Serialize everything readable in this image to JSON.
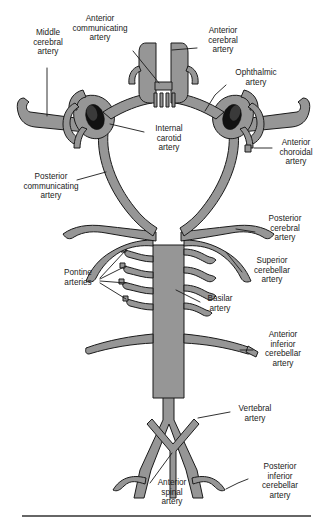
{
  "figure": {
    "colors": {
      "vessel_fill": "#969696",
      "vessel_outline": "#1a1a1a",
      "lumen": "#111111",
      "background": "#ffffff",
      "rule": "#333333"
    }
  },
  "labels": {
    "middle_cerebral": "Middle\ncerebral\nartery",
    "anterior_communicating": "Anterior\ncommunicating\nartery",
    "anterior_cerebral": "Anterior\ncerebral\nartery",
    "ophthalmic": "Ophthalmic\nartery",
    "internal_carotid": "Internal\ncarotid\nartery",
    "anterior_choroidal": "Anterior\nchoroidal\nartery",
    "posterior_communicating": "Posterior\ncommunicating\nartery",
    "posterior_cerebral": "Posterior\ncerebral\nartery",
    "superior_cerebellar": "Superior\ncerebellar\nartery",
    "pontine": "Pontine\narteries",
    "basilar": "Basilar\nartery",
    "anterior_inferior_cerebellar": "Anterior\ninferior\ncerebellar\nartery",
    "vertebral": "Vertebral\nartery",
    "anterior_spinal": "Anterior\nspinal\nartery",
    "posterior_inferior_cerebellar": "Posterior\ninferior\ncerebellar\nartery"
  },
  "structures": [
    {
      "name": "middle-cerebral-artery",
      "side": "bilateral"
    },
    {
      "name": "anterior-communicating-artery",
      "side": "midline"
    },
    {
      "name": "anterior-cerebral-artery",
      "side": "bilateral"
    },
    {
      "name": "ophthalmic-artery",
      "side": "bilateral"
    },
    {
      "name": "internal-carotid-artery",
      "side": "bilateral"
    },
    {
      "name": "anterior-choroidal-artery",
      "side": "bilateral"
    },
    {
      "name": "posterior-communicating-artery",
      "side": "bilateral"
    },
    {
      "name": "posterior-cerebral-artery",
      "side": "bilateral"
    },
    {
      "name": "superior-cerebellar-artery",
      "side": "bilateral"
    },
    {
      "name": "pontine-arteries",
      "side": "bilateral"
    },
    {
      "name": "basilar-artery",
      "side": "midline"
    },
    {
      "name": "anterior-inferior-cerebellar-artery",
      "side": "bilateral"
    },
    {
      "name": "vertebral-artery",
      "side": "bilateral"
    },
    {
      "name": "anterior-spinal-artery",
      "side": "midline"
    },
    {
      "name": "posterior-inferior-cerebellar-artery",
      "side": "bilateral"
    }
  ]
}
